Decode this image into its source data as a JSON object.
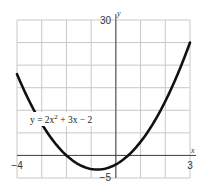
{
  "chart_data": {
    "type": "line",
    "title": "",
    "xlabel": "x",
    "ylabel": "y",
    "xlim": [
      -4,
      3
    ],
    "ylim": [
      -5,
      30
    ],
    "x_ticks_labeled": [
      "-4",
      "3"
    ],
    "y_ticks_labeled": [
      "30",
      "-5"
    ],
    "x_grid_step": 1,
    "y_grid_step": 5,
    "grid": true,
    "series": [
      {
        "name": "y = 2x^2 + 3x - 2",
        "equation": "y = 2x² + 3x − 2",
        "x": [
          -4,
          -3.5,
          -3,
          -2.5,
          -2,
          -1.5,
          -1,
          -0.75,
          -0.5,
          0,
          0.5,
          1,
          1.5,
          2,
          2.5,
          3
        ],
        "values": [
          18,
          11,
          7,
          3,
          0,
          -2,
          -3,
          -3.125,
          -3,
          -2,
          0,
          3,
          7,
          12,
          18,
          25
        ]
      }
    ],
    "annotations": [
      {
        "text": "y = 2x² + 3x − 2",
        "x": -3.5,
        "y": 8
      }
    ]
  },
  "labels": {
    "x_min": "−4",
    "x_max": "3",
    "y_max": "30",
    "y_min": "−5",
    "x_axis": "x",
    "y_axis": "y",
    "equation_prefix": "y = 2x",
    "equation_exp": "2",
    "equation_suffix": " + 3x − 2"
  }
}
